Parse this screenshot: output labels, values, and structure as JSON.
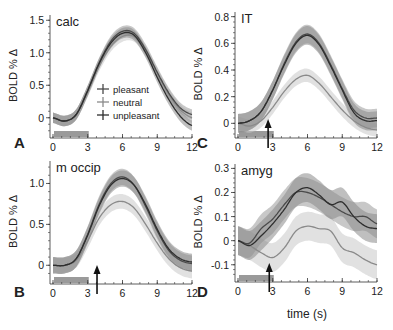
{
  "figure": {
    "xlabel_shared": "time (s)",
    "legend": [
      {
        "label": "pleasant",
        "color": "#4a4a4a"
      },
      {
        "label": "neutral",
        "color": "#8a8a8a"
      },
      {
        "label": "unpleasant",
        "color": "#2e2e2e"
      }
    ]
  },
  "chart_data": [
    {
      "type": "line",
      "panel": "A",
      "title": "calc",
      "xlabel": "",
      "ylabel": "BOLD % Δ",
      "xlim": [
        0,
        12
      ],
      "ylim": [
        -0.25,
        1.55
      ],
      "xticks": [
        0,
        3,
        6,
        9,
        12
      ],
      "yticks": [
        0,
        0.5,
        1.0,
        1.5
      ],
      "ytick_labels": [
        "0",
        "0.5",
        "1.0",
        "1.5"
      ],
      "stimulus_bar": [
        0,
        3
      ],
      "arrow_x": null,
      "legend": [
        "pleasant",
        "neutral",
        "unpleasant"
      ],
      "x": [
        0,
        1,
        2,
        3,
        4,
        5,
        6,
        7,
        8,
        9,
        10,
        11,
        12
      ],
      "series": [
        {
          "name": "pleasant",
          "values": [
            0,
            -0.05,
            0.05,
            0.42,
            0.85,
            1.18,
            1.33,
            1.3,
            1.05,
            0.7,
            0.38,
            0.15,
            0.05
          ],
          "err": 0.08
        },
        {
          "name": "neutral",
          "values": [
            0,
            -0.05,
            0.05,
            0.4,
            0.8,
            1.1,
            1.25,
            1.25,
            1.02,
            0.68,
            0.36,
            0.12,
            0.0
          ],
          "err": 0.08
        },
        {
          "name": "unpleasant",
          "values": [
            0,
            -0.05,
            0.05,
            0.42,
            0.84,
            1.15,
            1.3,
            1.27,
            1.0,
            0.62,
            0.28,
            0.02,
            -0.12
          ],
          "err": 0.08
        }
      ]
    },
    {
      "type": "line",
      "panel": "C",
      "title": "IT",
      "xlabel": "",
      "ylabel": "BOLD % Δ",
      "xlim": [
        0,
        12
      ],
      "ylim": [
        -0.08,
        0.82
      ],
      "xticks": [
        0,
        3,
        6,
        9,
        12
      ],
      "yticks": [
        0,
        0.2,
        0.4,
        0.6,
        0.8
      ],
      "ytick_labels": [
        "0",
        "0.2",
        "0.4",
        "0.6",
        "0.8"
      ],
      "stimulus_bar": [
        0,
        3
      ],
      "arrow_x": 2.6,
      "x": [
        0,
        1,
        2,
        3,
        4,
        5,
        6,
        7,
        8,
        9,
        10,
        11,
        12
      ],
      "series": [
        {
          "name": "pleasant",
          "values": [
            0,
            0.02,
            0.09,
            0.25,
            0.45,
            0.61,
            0.67,
            0.6,
            0.44,
            0.26,
            0.1,
            0.04,
            0.04
          ],
          "err": 0.07
        },
        {
          "name": "neutral",
          "values": [
            0,
            -0.02,
            0.02,
            0.12,
            0.24,
            0.33,
            0.36,
            0.3,
            0.2,
            0.1,
            0.02,
            -0.03,
            -0.05
          ],
          "err": 0.05
        },
        {
          "name": "unpleasant",
          "values": [
            0,
            0.02,
            0.09,
            0.25,
            0.44,
            0.6,
            0.66,
            0.59,
            0.43,
            0.25,
            0.08,
            0.02,
            0.02
          ],
          "err": 0.07
        }
      ]
    },
    {
      "type": "line",
      "panel": "B",
      "title": "m occip",
      "xlabel": "",
      "ylabel": "BOLD % Δ",
      "xlim": [
        0,
        12
      ],
      "ylim": [
        -0.18,
        1.25
      ],
      "xticks": [
        0,
        3,
        6,
        9,
        12
      ],
      "yticks": [
        0,
        0.5,
        1.0
      ],
      "ytick_labels": [
        "0",
        "0.5",
        "1.0"
      ],
      "stimulus_bar": [
        0,
        3
      ],
      "arrow_x": 3.8,
      "x": [
        0,
        1,
        2,
        3,
        4,
        5,
        6,
        7,
        8,
        9,
        10,
        11,
        12
      ],
      "series": [
        {
          "name": "pleasant",
          "values": [
            0,
            0.0,
            0.08,
            0.38,
            0.75,
            1.0,
            1.08,
            0.98,
            0.72,
            0.42,
            0.18,
            0.06,
            0.02
          ],
          "err": 0.1
        },
        {
          "name": "neutral",
          "values": [
            0,
            0.0,
            0.06,
            0.3,
            0.58,
            0.74,
            0.78,
            0.7,
            0.5,
            0.27,
            0.08,
            -0.03,
            -0.07
          ],
          "err": 0.09
        },
        {
          "name": "unpleasant",
          "values": [
            0,
            0.0,
            0.08,
            0.37,
            0.73,
            0.98,
            1.06,
            0.98,
            0.74,
            0.44,
            0.2,
            0.08,
            0.04
          ],
          "err": 0.1
        }
      ]
    },
    {
      "type": "line",
      "panel": "D",
      "title": "amyg",
      "xlabel": "time (s)",
      "ylabel": "BOLD % Δ",
      "xlim": [
        0,
        12
      ],
      "ylim": [
        -0.155,
        0.31
      ],
      "xticks": [
        0,
        3,
        6,
        9,
        12
      ],
      "yticks": [
        -0.1,
        0,
        0.1,
        0.2,
        0.3
      ],
      "ytick_labels": [
        "-0.1",
        "0",
        "0.1",
        "0.2",
        "0.3"
      ],
      "stimulus_bar": [
        0,
        3
      ],
      "arrow_x": 2.7,
      "x": [
        0,
        1,
        2,
        3,
        4,
        5,
        6,
        7,
        8,
        9,
        10,
        11,
        12
      ],
      "series": [
        {
          "name": "pleasant",
          "values": [
            0,
            -0.01,
            0.05,
            0.09,
            0.15,
            0.2,
            0.2,
            0.18,
            0.15,
            0.12,
            0.1,
            0.1,
            0.07
          ],
          "err": 0.06
        },
        {
          "name": "neutral",
          "values": [
            0,
            -0.02,
            -0.05,
            -0.07,
            -0.03,
            0.04,
            0.06,
            0.05,
            0.04,
            -0.03,
            -0.05,
            -0.08,
            -0.1
          ],
          "err": 0.06
        },
        {
          "name": "unpleasant",
          "values": [
            0,
            -0.02,
            0.02,
            0.07,
            0.13,
            0.2,
            0.22,
            0.19,
            0.15,
            0.16,
            0.1,
            0.06,
            0.05
          ],
          "err": 0.06
        }
      ]
    }
  ],
  "panels_layout": [
    {
      "letter": "A",
      "plot": {
        "left": 53,
        "right": 192,
        "top": 17,
        "bottom": 134,
        "axis_y": 138
      },
      "letter_pos": [
        14,
        148
      ]
    },
    {
      "letter": "C",
      "plot": {
        "left": 238,
        "right": 377,
        "top": 14,
        "bottom": 134,
        "axis_y": 138
      },
      "letter_pos": [
        197,
        148
      ]
    },
    {
      "letter": "B",
      "plot": {
        "left": 53,
        "right": 192,
        "top": 163,
        "bottom": 280,
        "axis_y": 284
      },
      "letter_pos": [
        14,
        297
      ]
    },
    {
      "letter": "D",
      "plot": {
        "left": 238,
        "right": 377,
        "top": 166,
        "bottom": 278,
        "axis_y": 282
      },
      "letter_pos": [
        197,
        297
      ]
    }
  ]
}
